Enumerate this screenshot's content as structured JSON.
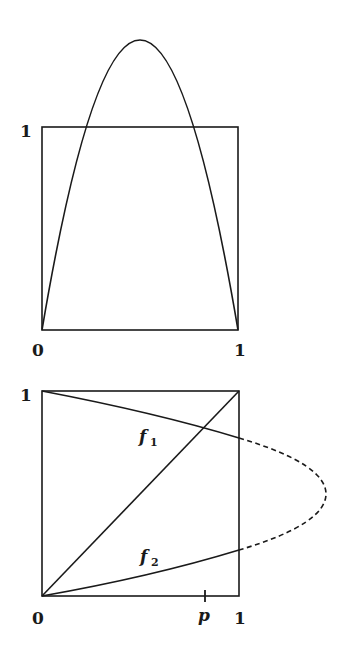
{
  "figure": {
    "top_panel": {
      "description": "Graph of unimodal map f(x)=mu*x*(1-x) exceeding the unit square",
      "labels": {
        "y_one": "1",
        "x_zero": "0",
        "x_one": "1"
      },
      "parabola_peak_value": 1.43
    },
    "bottom_panel": {
      "description": "Inverse branches f1 and f2 with diagonal; dashed continuation outside unit square",
      "labels": {
        "y_one": "1",
        "x_zero": "0",
        "x_one": "1",
        "tick_p": "p",
        "branch_upper": "f",
        "branch_upper_sub": "1",
        "branch_lower": "f",
        "branch_lower_sub": "2"
      },
      "p_value": 0.83,
      "dashed_apex_x": 1.43
    },
    "colors": {
      "stroke": "#1a1a1a",
      "background": "#ffffff"
    }
  }
}
